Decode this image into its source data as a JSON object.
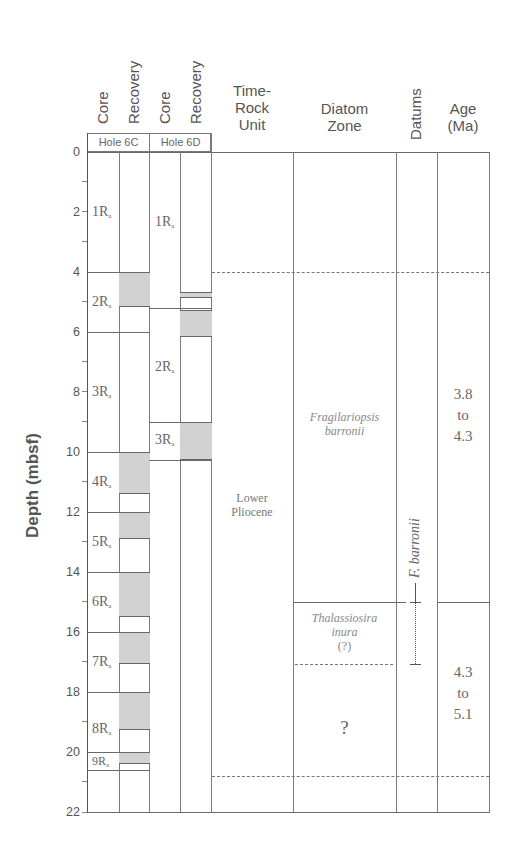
{
  "y_axis": {
    "label": "Depth (mbsf)",
    "ticks": [
      "0",
      "2",
      "4",
      "6",
      "8",
      "10",
      "12",
      "14",
      "16",
      "18",
      "20",
      "22"
    ]
  },
  "headers": {
    "core_6c": "Core",
    "recovery_6c": "Recovery",
    "core_6d": "Core",
    "recovery_6d": "Recovery",
    "hole_6c": "Hole 6C",
    "hole_6d": "Hole 6D",
    "time_rock_line1": "Time-",
    "time_rock_line2": "Rock",
    "time_rock_line3": "Unit",
    "diatom_line1": "Diatom",
    "diatom_line2": "Zone",
    "datums": "Datums",
    "age_line1": "Age",
    "age_line2": "(Ma)"
  },
  "hole_6c": {
    "cores": [
      {
        "label": "1R",
        "sub": "a",
        "top": 0,
        "bottom": 4
      },
      {
        "label": "2R",
        "sub": "a",
        "top": 4,
        "bottom": 6
      },
      {
        "label": "3R",
        "sub": "a",
        "top": 6,
        "bottom": 10
      },
      {
        "label": "4R",
        "sub": "a",
        "top": 10,
        "bottom": 12
      },
      {
        "label": "5R",
        "sub": "a",
        "top": 12,
        "bottom": 14
      },
      {
        "label": "6R",
        "sub": "a",
        "top": 14,
        "bottom": 16
      },
      {
        "label": "7R",
        "sub": "a",
        "top": 16,
        "bottom": 18
      },
      {
        "label": "8R",
        "sub": "a",
        "top": 18,
        "bottom": 20
      },
      {
        "label": "9R",
        "sub": "a",
        "top": 20,
        "bottom": 20.6
      }
    ],
    "recovery": [
      {
        "top": 4,
        "bottom": 5.15
      },
      {
        "top": 10,
        "bottom": 11.4
      },
      {
        "top": 12,
        "bottom": 12.9
      },
      {
        "top": 14,
        "bottom": 15.5
      },
      {
        "top": 16,
        "bottom": 17.05
      },
      {
        "top": 18,
        "bottom": 19.25
      },
      {
        "top": 20,
        "bottom": 20.4
      }
    ]
  },
  "hole_6d": {
    "cores": [
      {
        "label": "1R",
        "sub": "a",
        "top": 0,
        "bottom": 5.2
      },
      {
        "label": "2R",
        "sub": "a",
        "top": 5.2,
        "bottom": 9
      },
      {
        "label": "3R",
        "sub": "a",
        "top": 9,
        "bottom": 10.25
      }
    ],
    "recovery": [
      {
        "top": 4.65,
        "bottom": 4.85
      },
      {
        "top": 5.25,
        "bottom": 6.15
      },
      {
        "top": 9,
        "bottom": 10.25
      }
    ]
  },
  "time_rock_unit": {
    "line1": "Lower",
    "line2": "Pliocene",
    "top": 4,
    "bottom": 20.8
  },
  "diatom_zones": {
    "zone1_line1": "Fragilariopsis",
    "zone1_line2": "barronii",
    "zone2_line1": "Thalassiosira",
    "zone2_line2": "inura",
    "zone2_line3": "(?)",
    "zone3": "?",
    "boundaries": {
      "top": 4,
      "zone1_zone2": 15,
      "zone2_zone3": 17.1,
      "bottom": 20.8
    }
  },
  "datums": {
    "label": "F. barronii",
    "solid_tick_depth": 15,
    "dotted_to_depth": 17.1
  },
  "age": {
    "upper_line1": "3.8",
    "upper_line2": "to",
    "upper_line3": "4.3",
    "lower_line1": "4.3",
    "lower_line2": "to",
    "lower_line3": "5.1",
    "boundary_depth": 15
  }
}
